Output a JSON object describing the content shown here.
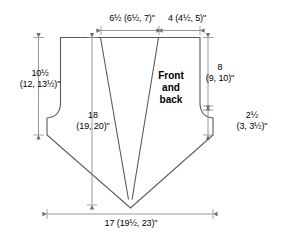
{
  "diagram": {
    "piece_label": {
      "lines": [
        "Front",
        "and",
        "back"
      ]
    },
    "stroke_color": "#58595b",
    "dimension_color": "#8c8c8c",
    "text_color": "#000000",
    "background": "#ffffff",
    "dimensions": {
      "top_left": {
        "name": "shoulder-to-dart-width",
        "lines": [
          "6½ (6½, 7)\""
        ]
      },
      "top_right": {
        "name": "dart-to-side-width",
        "lines": [
          "4 (4½, 5)\""
        ]
      },
      "left": {
        "name": "side-seam-to-underarm-height",
        "lines": [
          "10½",
          "(12, 13½)\""
        ]
      },
      "middle": {
        "name": "center-front-length",
        "lines": [
          "18",
          "(19, 20)\""
        ]
      },
      "right_top": {
        "name": "armhole-depth",
        "lines": [
          "8",
          "(9, 10)\""
        ]
      },
      "right_bottom": {
        "name": "underarm-gusset-height",
        "lines": [
          "2½",
          "(3, 3½)\""
        ]
      },
      "bottom": {
        "name": "total-width",
        "lines": [
          "17 (19½, 23)\""
        ]
      }
    }
  }
}
